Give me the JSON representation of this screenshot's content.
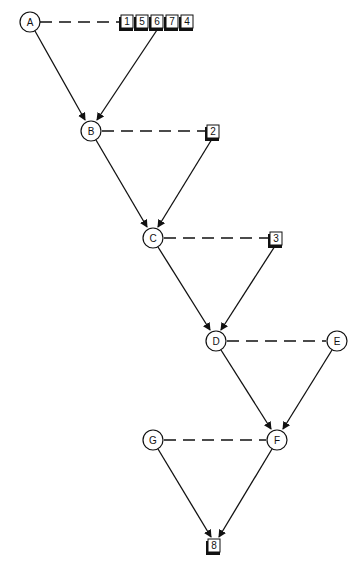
{
  "diagram": {
    "type": "precedence network",
    "nodes": [
      {
        "id": "A",
        "label": "A",
        "x": 30,
        "y": 22
      },
      {
        "id": "B",
        "label": "B",
        "x": 91,
        "y": 131
      },
      {
        "id": "C",
        "label": "C",
        "x": 153,
        "y": 238
      },
      {
        "id": "D",
        "label": "D",
        "x": 216,
        "y": 341
      },
      {
        "id": "E",
        "label": "E",
        "x": 337,
        "y": 341
      },
      {
        "id": "G",
        "label": "G",
        "x": 153,
        "y": 440
      },
      {
        "id": "F",
        "label": "F",
        "x": 277,
        "y": 440
      }
    ],
    "boxes": [
      {
        "id": "b1",
        "label": "1",
        "x": 121,
        "y": 15
      },
      {
        "id": "b5",
        "label": "5",
        "x": 136,
        "y": 15
      },
      {
        "id": "b6",
        "label": "6",
        "x": 151,
        "y": 15
      },
      {
        "id": "b7",
        "label": "7",
        "x": 166,
        "y": 15
      },
      {
        "id": "b4",
        "label": "4",
        "x": 181,
        "y": 15
      },
      {
        "id": "b2",
        "label": "2",
        "x": 207,
        "y": 125
      },
      {
        "id": "b3",
        "label": "3",
        "x": 270,
        "y": 232
      },
      {
        "id": "b8",
        "label": "8",
        "x": 208,
        "y": 539
      }
    ],
    "arrows": [
      {
        "from": "A",
        "to": "B"
      },
      {
        "from": "b6",
        "to": "B"
      },
      {
        "from": "B",
        "to": "C"
      },
      {
        "from": "b2",
        "to": "C"
      },
      {
        "from": "C",
        "to": "D"
      },
      {
        "from": "b3",
        "to": "D"
      },
      {
        "from": "D",
        "to": "F"
      },
      {
        "from": "E",
        "to": "F"
      },
      {
        "from": "G",
        "to": "b8"
      },
      {
        "from": "F",
        "to": "b8"
      }
    ],
    "dashed_links": [
      {
        "from": "A",
        "to": "b1"
      },
      {
        "from": "B",
        "to": "b2"
      },
      {
        "from": "C",
        "to": "b3"
      },
      {
        "from": "D",
        "to": "E"
      },
      {
        "from": "G",
        "to": "F"
      }
    ],
    "colors": {
      "stroke": "#111111",
      "background": "#ffffff",
      "box_shadow": "#111111"
    }
  }
}
